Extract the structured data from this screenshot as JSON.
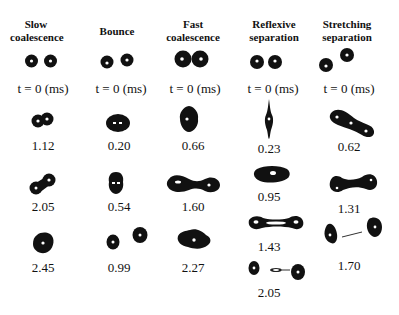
{
  "columns": [
    {
      "title_line1": "Slow",
      "title_line2": "coalescence",
      "frames": [
        "t = 0 (ms)",
        "1.12",
        "2.05",
        "2.45"
      ]
    },
    {
      "title_line1": "",
      "title_line2": "Bounce",
      "frames": [
        "t = 0 (ms)",
        "0.20",
        "0.54",
        "0.99"
      ]
    },
    {
      "title_line1": "Fast",
      "title_line2": "coalescence",
      "frames": [
        "t = 0 (ms)",
        "0.66",
        "1.60",
        "2.27"
      ]
    },
    {
      "title_line1": "Reflexive",
      "title_line2": "separation",
      "frames": [
        "t = 0 (ms)",
        "0.23",
        "0.95",
        "1.43",
        "2.05"
      ]
    },
    {
      "title_line1": "Stretching",
      "title_line2": "separation",
      "frames": [
        "t = 0 (ms)",
        "0.62",
        "1.31",
        "1.70"
      ]
    }
  ],
  "colors": {
    "droplet": "#111111",
    "highlight": "#ffffff",
    "background": "#ffffff"
  }
}
